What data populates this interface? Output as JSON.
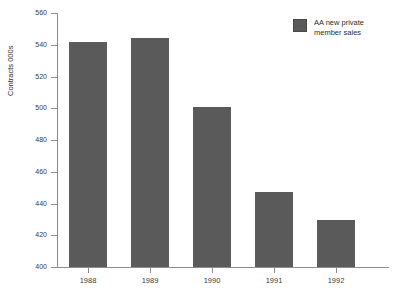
{
  "chart_data": {
    "type": "bar",
    "title": "",
    "subtitle": "",
    "xlabel": "",
    "ylabel": "Contracts 000s",
    "categories": [
      "1988",
      "1989",
      "1990",
      "1991",
      "1992"
    ],
    "values": [
      541.5,
      544,
      501,
      447,
      429.5
    ],
    "series": [
      {
        "name": "AA new private member sales",
        "values": [
          541.5,
          544,
          501,
          447,
          429.5
        ]
      }
    ],
    "ylim": [
      400,
      560
    ],
    "yticks": [
      400,
      420,
      440,
      460,
      480,
      500,
      520,
      540,
      560
    ],
    "ytick_labels": [
      "400",
      "420",
      "440",
      "460",
      "480",
      "500",
      "520",
      "540",
      "560"
    ],
    "grid": false,
    "legend_position": "top-right",
    "legend": [
      {
        "label_line1": "AA new private",
        "label_line2": "member sales",
        "color": "#5a5a5a"
      }
    ],
    "colors": {
      "bar": "#5a5a5a",
      "axis": "#8d8d8d",
      "text": "#2b2b2b",
      "background": "#ffffff"
    }
  }
}
